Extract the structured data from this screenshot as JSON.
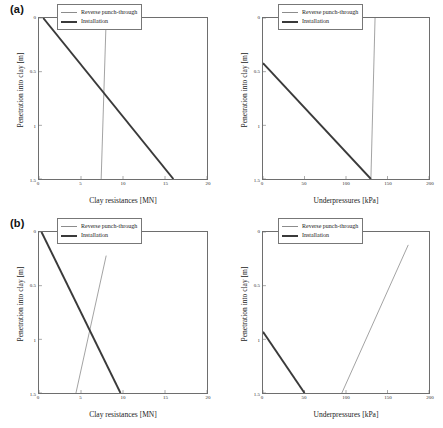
{
  "figure": {
    "rows": [
      {
        "label": "(a)"
      },
      {
        "label": "(b)"
      }
    ]
  },
  "legend": {
    "reverse_label": "Reverse punch-through",
    "installation_label": "Installation"
  },
  "colors": {
    "reverse_punch_through": "#8c8c8c",
    "installation": "#3a3a3a",
    "axis": "#6e6e6e",
    "text": "#1a1a1a"
  },
  "chart_data": [
    {
      "type": "line",
      "panel": "a-left",
      "title": "",
      "xlabel": "Clay resistances [MN]",
      "ylabel": "Penetration into clay [m]",
      "xlim": [
        0,
        20
      ],
      "ylim": [
        0,
        1.5
      ],
      "y_inverted": true,
      "grid": false,
      "legend_position": "upper right",
      "xticks": [
        0,
        5,
        10,
        15,
        20
      ],
      "xticklabels": [
        "0",
        "5",
        "10",
        "15",
        "20"
      ],
      "yticks": [
        0,
        0.5,
        1,
        1.5
      ],
      "yticklabels": [
        "0",
        "0.5",
        "1",
        "1.5"
      ],
      "series": [
        {
          "name": "Installation",
          "x": [
            0.5,
            16.0
          ],
          "y": [
            0,
            1.5
          ]
        },
        {
          "name": "Reverse punch-through",
          "x": [
            8.0,
            7.4
          ],
          "y": [
            0,
            1.5
          ]
        }
      ]
    },
    {
      "type": "line",
      "panel": "a-right",
      "title": "",
      "xlabel": "Underpressures [kPa]",
      "ylabel": "Penetration into clay [m]",
      "xlim": [
        0,
        200
      ],
      "ylim": [
        0,
        1.5
      ],
      "y_inverted": true,
      "grid": false,
      "legend_position": "upper right",
      "xticks": [
        0,
        50,
        100,
        150,
        200
      ],
      "xticklabels": [
        "0",
        "50",
        "100",
        "150",
        "200"
      ],
      "yticks": [
        0,
        0.5,
        1,
        1.5
      ],
      "yticklabels": [
        "0",
        "0.5",
        "1",
        "1.5"
      ],
      "series": [
        {
          "name": "Installation",
          "x": [
            0,
            130
          ],
          "y": [
            0.42,
            1.5
          ]
        },
        {
          "name": "Reverse punch-through",
          "x": [
            135,
            130
          ],
          "y": [
            0,
            1.5
          ]
        }
      ]
    },
    {
      "type": "line",
      "panel": "b-left",
      "title": "",
      "xlabel": "Clay resistances [MN]",
      "ylabel": "Penetration into clay [m]",
      "xlim": [
        0,
        20
      ],
      "ylim": [
        0,
        1.5
      ],
      "y_inverted": true,
      "grid": false,
      "legend_position": "upper right",
      "xticks": [
        0,
        5,
        10,
        15,
        20
      ],
      "xticklabels": [
        "0",
        "5",
        "10",
        "15",
        "20"
      ],
      "yticks": [
        0,
        0.5,
        1,
        1.5
      ],
      "yticklabels": [
        "0",
        "0.5",
        "1",
        "1.5"
      ],
      "series": [
        {
          "name": "Installation",
          "x": [
            0.3,
            9.7
          ],
          "y": [
            0,
            1.5
          ]
        },
        {
          "name": "Reverse punch-through",
          "x": [
            8.0,
            4.4
          ],
          "y": [
            0.22,
            1.5
          ]
        }
      ]
    },
    {
      "type": "line",
      "panel": "b-right",
      "title": "",
      "xlabel": "Underpressures [kPa]",
      "ylabel": "Penetration into clay [m]",
      "xlim": [
        0,
        200
      ],
      "ylim": [
        0,
        1.5
      ],
      "y_inverted": true,
      "grid": false,
      "legend_position": "upper right",
      "xticks": [
        0,
        50,
        100,
        150,
        200
      ],
      "xticklabels": [
        "0",
        "50",
        "100",
        "150",
        "200"
      ],
      "yticks": [
        0,
        0.5,
        1,
        1.5
      ],
      "yticklabels": [
        "0",
        "0.5",
        "1",
        "1.5"
      ],
      "series": [
        {
          "name": "Installation",
          "x": [
            0,
            50
          ],
          "y": [
            0.93,
            1.5
          ]
        },
        {
          "name": "Reverse punch-through",
          "x": [
            175,
            95
          ],
          "y": [
            0.12,
            1.5
          ]
        }
      ]
    }
  ]
}
